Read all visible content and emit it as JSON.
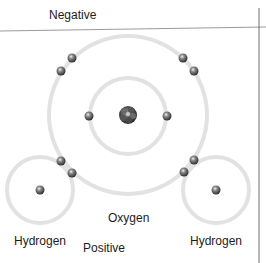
{
  "diagram": {
    "title_top": "Negative",
    "title_bottom": "Positive",
    "oxygen_label": "Oxygen",
    "hydrogen_left_label": "Hydrogen",
    "hydrogen_right_label": "Hydrogen",
    "colors": {
      "orbit": "#e2e2e2",
      "electron": "#5a5a5a",
      "nucleus": "#3a3a3a",
      "rule_line": "#8a8a8a",
      "text": "#1c1c1c"
    },
    "oxygen": {
      "center": [
        128,
        115
      ],
      "outer_orbit_radius": 79,
      "inner_orbit_radius": 38,
      "inner_electrons": [
        [
          89,
          116
        ],
        [
          167,
          116
        ]
      ],
      "outer_electrons": [
        [
          72,
          58
        ],
        [
          61,
          71
        ],
        [
          183,
          58
        ],
        [
          194,
          71
        ],
        [
          61,
          161
        ],
        [
          72,
          173
        ],
        [
          194,
          160
        ],
        [
          184,
          172
        ]
      ]
    },
    "hydrogens": [
      {
        "center": [
          40,
          190
        ],
        "orbit_radius": 33,
        "electron": [
          40,
          190
        ]
      },
      {
        "center": [
          216,
          190
        ],
        "orbit_radius": 33,
        "electron": [
          216,
          190
        ]
      }
    ]
  }
}
